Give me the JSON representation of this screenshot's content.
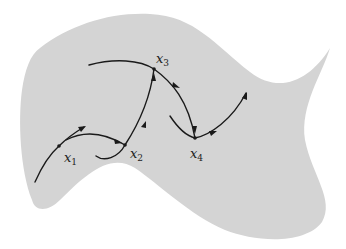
{
  "diagram": {
    "region_color": "#d4d4d4",
    "curve_color": "#1a1a1a",
    "points": [
      {
        "id": "x1",
        "label_base": "x",
        "label_sub": "1"
      },
      {
        "id": "x2",
        "label_base": "x",
        "label_sub": "2"
      },
      {
        "id": "x3",
        "label_base": "x",
        "label_sub": "3"
      },
      {
        "id": "x4",
        "label_base": "x",
        "label_sub": "4"
      }
    ]
  }
}
